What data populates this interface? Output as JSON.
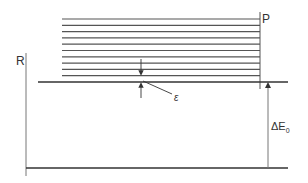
{
  "diagram": {
    "labels": {
      "p": "P",
      "r": "R",
      "epsilon": "ε",
      "delta_e": "ΔE",
      "delta_e_sub": "0"
    },
    "levels": {
      "p_lines_count": 10,
      "p_lines_y": [
        19,
        25.3,
        31.6,
        37.9,
        44.2,
        50.5,
        56.8,
        63.1,
        69.4,
        75.7
      ],
      "p_lines_x": [
        62,
        260
      ],
      "r_top_level_y": 82,
      "r_top_level_x": [
        38,
        288
      ],
      "bottom_level_y": 168,
      "bottom_level_x": [
        26,
        288
      ]
    },
    "colors": {
      "line": "#333333",
      "thin_line": "#555555",
      "background": "#ffffff"
    }
  }
}
